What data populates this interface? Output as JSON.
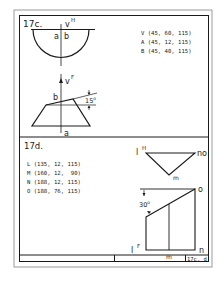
{
  "sheet": {
    "stroke_color": "#1a1a1a",
    "outer_frame_color": "#9a9a9a",
    "background": "#ffffff"
  },
  "problem_c": {
    "label": "17c.",
    "top_view": {
      "apex_label": "v",
      "apex_superscript": "H",
      "point_a": "a",
      "point_b": "b"
    },
    "front_view": {
      "apex_label": "v",
      "apex_superscript": "F",
      "point_b": "b",
      "point_a": "a",
      "angle_value": "15",
      "angle_unit": "o"
    },
    "coordinates": [
      {
        "point": "V",
        "value": "(45, 60, 115)"
      },
      {
        "point": "A",
        "value": "(45, 12, 115)"
      },
      {
        "point": "B",
        "value": "(45, 40, 115)"
      }
    ]
  },
  "problem_d": {
    "label": "17d.",
    "coordinates": [
      {
        "point": "L",
        "value": "(135, 12, 115)"
      },
      {
        "point": "M",
        "value": "(160, 12,  90)"
      },
      {
        "point": "N",
        "value": "(188, 12, 115)"
      },
      {
        "point": "O",
        "value": "(188, 76, 115)"
      }
    ],
    "top_view": {
      "l_label": "l",
      "l_superscript": "H",
      "no_label": "no",
      "m_label": "m"
    },
    "front_view": {
      "o_label": "o",
      "n_label": "n",
      "m_label": "m",
      "l_label": "l",
      "l_superscript": "F",
      "angle_value": "30",
      "angle_unit": "o"
    }
  },
  "title_block": {
    "sheet_ref": "17c, d"
  }
}
